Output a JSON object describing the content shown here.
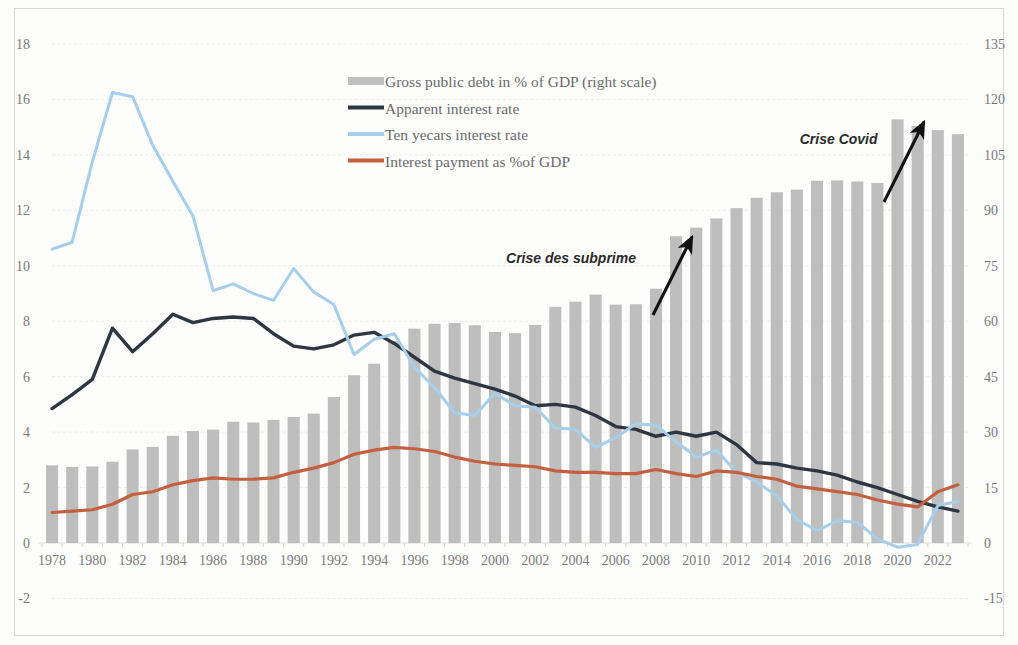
{
  "chart_data": {
    "type": "line",
    "title": "",
    "subtitle": "",
    "xlabel": "",
    "ylabel": "",
    "y2label": "",
    "grid": true,
    "legend_position": "top-center",
    "xlim": [
      1977.4,
      2023.6
    ],
    "ylim": [
      -2,
      18
    ],
    "y2lim": [
      -15,
      135
    ],
    "yticks": [
      -2,
      0,
      2,
      4,
      6,
      8,
      10,
      12,
      14,
      16,
      18
    ],
    "y2ticks": [
      -15,
      0,
      15,
      30,
      45,
      60,
      75,
      90,
      105,
      120,
      135
    ],
    "ytick_labels": [
      "-2",
      "0",
      "2",
      "4",
      "6",
      "8",
      "10",
      "12",
      "14",
      "16",
      "18"
    ],
    "y2tick_labels": [
      "-15",
      "0",
      "15",
      "30",
      "45",
      "60",
      "75",
      "90",
      "105",
      "120",
      "135"
    ],
    "x": [
      1978,
      1979,
      1980,
      1981,
      1982,
      1983,
      1984,
      1985,
      1986,
      1987,
      1988,
      1989,
      1990,
      1991,
      1992,
      1993,
      1994,
      1995,
      1996,
      1997,
      1998,
      1999,
      2000,
      2001,
      2002,
      2003,
      2004,
      2005,
      2006,
      2007,
      2008,
      2009,
      2010,
      2011,
      2012,
      2013,
      2014,
      2015,
      2016,
      2017,
      2018,
      2019,
      2020,
      2021,
      2022,
      2023
    ],
    "xtick_labels": [
      "1978",
      "1980",
      "1982",
      "1984",
      "1986",
      "1988",
      "1990",
      "1992",
      "1994",
      "1996",
      "1998",
      "2000",
      "2002",
      "2004",
      "2006",
      "2008",
      "2010",
      "2012",
      "2014",
      "2016",
      "2018",
      "2020",
      "2022"
    ],
    "xticks": [
      1978,
      1980,
      1982,
      1984,
      1986,
      1988,
      1990,
      1992,
      1994,
      1996,
      1998,
      2000,
      2002,
      2004,
      2006,
      2008,
      2010,
      2012,
      2014,
      2016,
      2018,
      2020,
      2022
    ],
    "series": [
      {
        "name": "Gross public debt in % of GDP (right scale)",
        "type": "bar",
        "axis": "right",
        "color": "#b8b8b8",
        "values": [
          21.0,
          20.6,
          20.7,
          22.0,
          25.3,
          26.0,
          29.0,
          30.3,
          30.7,
          32.8,
          32.6,
          33.3,
          34.1,
          35.0,
          39.5,
          45.4,
          48.5,
          54.6,
          58.0,
          59.3,
          59.5,
          58.9,
          57.1,
          56.8,
          59.0,
          63.9,
          65.3,
          67.2,
          64.5,
          64.6,
          68.8,
          83.0,
          85.3,
          87.8,
          90.6,
          93.4,
          94.9,
          95.6,
          98.0,
          98.1,
          97.8,
          97.4,
          114.6,
          112.8,
          111.7,
          110.6
        ]
      },
      {
        "name": "Apparent interest rate",
        "type": "line",
        "axis": "left",
        "color": "#2e3642",
        "values": [
          4.85,
          5.35,
          5.9,
          7.75,
          6.9,
          7.55,
          8.25,
          7.95,
          8.1,
          8.15,
          8.1,
          7.55,
          7.1,
          7.0,
          7.15,
          7.5,
          7.6,
          7.2,
          6.7,
          6.2,
          5.95,
          5.75,
          5.55,
          5.3,
          4.95,
          5.0,
          4.9,
          4.6,
          4.2,
          4.1,
          3.85,
          4.0,
          3.85,
          4.0,
          3.55,
          2.9,
          2.85,
          2.7,
          2.6,
          2.45,
          2.2,
          2.0,
          1.75,
          1.5,
          1.3,
          1.15
        ]
      },
      {
        "name": "Ten yecars interest rate",
        "type": "line",
        "axis": "left",
        "color": "#a5cfec",
        "values": [
          10.6,
          10.85,
          13.75,
          16.25,
          16.1,
          14.35,
          13.05,
          11.8,
          9.1,
          9.35,
          9.0,
          8.75,
          9.9,
          9.05,
          8.6,
          6.8,
          7.35,
          7.55,
          6.35,
          5.6,
          4.7,
          4.6,
          5.4,
          4.95,
          4.9,
          4.15,
          4.1,
          3.45,
          3.8,
          4.3,
          4.25,
          3.65,
          3.1,
          3.35,
          2.55,
          2.2,
          1.7,
          0.85,
          0.45,
          0.8,
          0.75,
          0.15,
          -0.15,
          -0.05,
          1.35,
          1.5
        ]
      },
      {
        "name": "Interest payment as %of GDP",
        "type": "line",
        "axis": "left",
        "color": "#c4603f",
        "values": [
          1.1,
          1.15,
          1.2,
          1.4,
          1.75,
          1.85,
          2.1,
          2.25,
          2.35,
          2.3,
          2.3,
          2.35,
          2.55,
          2.7,
          2.9,
          3.2,
          3.35,
          3.45,
          3.4,
          3.3,
          3.1,
          2.95,
          2.85,
          2.8,
          2.75,
          2.6,
          2.55,
          2.55,
          2.5,
          2.5,
          2.65,
          2.5,
          2.4,
          2.6,
          2.55,
          2.4,
          2.3,
          2.05,
          1.95,
          1.85,
          1.75,
          1.55,
          1.4,
          1.3,
          1.85,
          2.1
        ]
      }
    ],
    "annotations": [
      {
        "text": "Crise des subprime",
        "x": 2008,
        "y": 10.1
      },
      {
        "text": "Crise Covid",
        "x": 2020,
        "y": 14.4
      }
    ]
  },
  "legend": {
    "items": [
      {
        "label": "Gross public debt in % of GDP (right scale)",
        "marker": "bar-swatch",
        "color": "#b8b8b8"
      },
      {
        "label": "Apparent interest rate",
        "marker": "line-swatch",
        "color": "#2e3642"
      },
      {
        "label": "Ten yecars interest rate",
        "marker": "line-swatch",
        "color": "#a5cfec"
      },
      {
        "label": "Interest payment as %of GDP",
        "marker": "line-swatch",
        "color": "#c4603f"
      }
    ]
  }
}
